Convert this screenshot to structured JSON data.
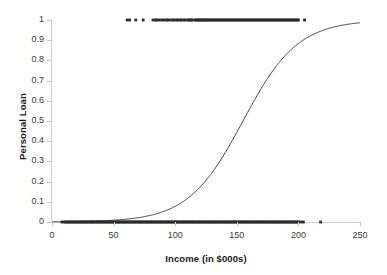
{
  "chart_data": {
    "type": "line",
    "title": "",
    "xlabel": "Income (in $000s)",
    "ylabel": "Personal Loan",
    "xlim": [
      0,
      250
    ],
    "ylim": [
      0,
      1
    ],
    "grid": false,
    "legend": "none",
    "xticks": [
      "0",
      "50",
      "100",
      "150",
      "200",
      "250"
    ],
    "xtick_values": [
      0,
      50,
      100,
      150,
      200,
      250
    ],
    "yticks": [
      "0",
      "0.1",
      "0.2",
      "0.3",
      "0.4",
      "0.5",
      "0.6",
      "0.7",
      "0.8",
      "0.9",
      "1"
    ],
    "ytick_values": [
      0,
      0.1,
      0.2,
      0.3,
      0.4,
      0.5,
      0.6,
      0.7,
      0.8,
      0.9,
      1
    ],
    "series": [
      {
        "name": "logistic fit",
        "type": "line",
        "color": "#404040",
        "midpoint": 155,
        "slope": 0.045,
        "x": [
          0,
          10,
          20,
          30,
          40,
          50,
          60,
          70,
          80,
          90,
          100,
          110,
          120,
          130,
          140,
          150,
          160,
          170,
          180,
          190,
          200,
          210,
          220,
          230,
          240,
          250
        ],
        "values": [
          0.001,
          0.002,
          0.003,
          0.004,
          0.007,
          0.011,
          0.017,
          0.026,
          0.04,
          0.062,
          0.094,
          0.14,
          0.203,
          0.285,
          0.382,
          0.486,
          0.59,
          0.685,
          0.765,
          0.828,
          0.876,
          0.911,
          0.937,
          0.955,
          0.968,
          0.977
        ]
      },
      {
        "name": "observations Personal Loan = 1",
        "type": "scatter",
        "color": "#2b2b2b",
        "y_value": 1,
        "x": [
          61,
          63,
          68,
          74,
          82,
          84,
          85,
          87,
          89,
          91,
          93,
          94,
          96,
          98,
          99,
          101,
          102,
          104,
          105,
          107,
          108,
          110,
          111,
          112,
          113,
          114,
          116,
          117,
          118,
          119,
          120,
          121,
          122,
          123,
          124,
          125,
          126,
          127,
          128,
          129,
          130,
          131,
          132,
          133,
          134,
          135,
          136,
          137,
          138,
          139,
          140,
          141,
          142,
          143,
          144,
          145,
          146,
          147,
          148,
          149,
          150,
          151,
          152,
          153,
          154,
          155,
          156,
          157,
          158,
          159,
          160,
          161,
          162,
          163,
          164,
          165,
          166,
          167,
          168,
          169,
          170,
          171,
          172,
          173,
          174,
          175,
          176,
          177,
          178,
          179,
          180,
          181,
          182,
          183,
          184,
          185,
          186,
          187,
          188,
          189,
          190,
          191,
          192,
          193,
          194,
          195,
          196,
          197,
          198,
          199,
          200,
          205
        ]
      },
      {
        "name": "observations Personal Loan = 0",
        "type": "scatter",
        "color": "#2b2b2b",
        "y_value": 0,
        "x": [
          8,
          10,
          11,
          12,
          13,
          14,
          15,
          16,
          17,
          18,
          19,
          20,
          21,
          22,
          23,
          24,
          25,
          26,
          27,
          28,
          29,
          30,
          31,
          32,
          33,
          34,
          35,
          36,
          37,
          38,
          39,
          40,
          41,
          42,
          43,
          44,
          45,
          46,
          47,
          48,
          49,
          50,
          51,
          52,
          53,
          54,
          55,
          56,
          57,
          58,
          59,
          60,
          61,
          62,
          63,
          64,
          65,
          66,
          67,
          68,
          69,
          70,
          71,
          72,
          73,
          74,
          75,
          76,
          77,
          78,
          79,
          80,
          81,
          82,
          83,
          84,
          85,
          86,
          87,
          88,
          89,
          90,
          91,
          92,
          93,
          94,
          95,
          96,
          97,
          98,
          99,
          100,
          101,
          102,
          103,
          104,
          105,
          106,
          107,
          108,
          109,
          110,
          111,
          112,
          113,
          114,
          115,
          116,
          117,
          118,
          119,
          120,
          121,
          122,
          123,
          124,
          125,
          126,
          127,
          128,
          129,
          130,
          131,
          132,
          133,
          134,
          135,
          136,
          137,
          138,
          139,
          140,
          141,
          142,
          143,
          144,
          145,
          146,
          147,
          148,
          149,
          150,
          151,
          152,
          153,
          154,
          155,
          156,
          157,
          158,
          159,
          160,
          161,
          162,
          163,
          164,
          165,
          166,
          167,
          168,
          169,
          170,
          171,
          172,
          173,
          174,
          175,
          176,
          177,
          178,
          179,
          180,
          181,
          182,
          183,
          184,
          185,
          186,
          187,
          188,
          189,
          190,
          191,
          192,
          193,
          194,
          195,
          196,
          197,
          198,
          199,
          200,
          202,
          204,
          218
        ]
      }
    ]
  },
  "colors": {
    "background": "#ffffff",
    "axis": "#d2d2d2",
    "text": "#3a3a3a",
    "title_text": "#1a1a1a",
    "curve": "#404040",
    "marker": "#2b2b2b"
  }
}
